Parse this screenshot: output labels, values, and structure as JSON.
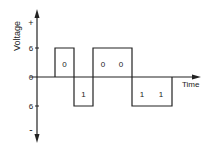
{
  "diagram": {
    "type": "bipolar-line-code-waveform",
    "y_axis": {
      "label": "Voltage",
      "plus_label": "+",
      "minus_label": "-",
      "ticks": [
        {
          "label": "6",
          "value": 6
        },
        {
          "label": "0",
          "value": 0
        },
        {
          "label": "6",
          "value": -6
        }
      ]
    },
    "x_axis": {
      "label": "Time"
    },
    "pulses": [
      {
        "bit": "0",
        "level": 6
      },
      {
        "bit": "1",
        "level": -6
      },
      {
        "bit": "0",
        "level": 6
      },
      {
        "bit": "0",
        "level": 6
      },
      {
        "bit": "1",
        "level": -6
      },
      {
        "bit": "1",
        "level": -6
      }
    ],
    "bit_labels": [
      "0",
      "1",
      "0",
      "0",
      "1",
      "1"
    ],
    "colors": {
      "line": "#222222",
      "background": "#ffffff"
    }
  }
}
